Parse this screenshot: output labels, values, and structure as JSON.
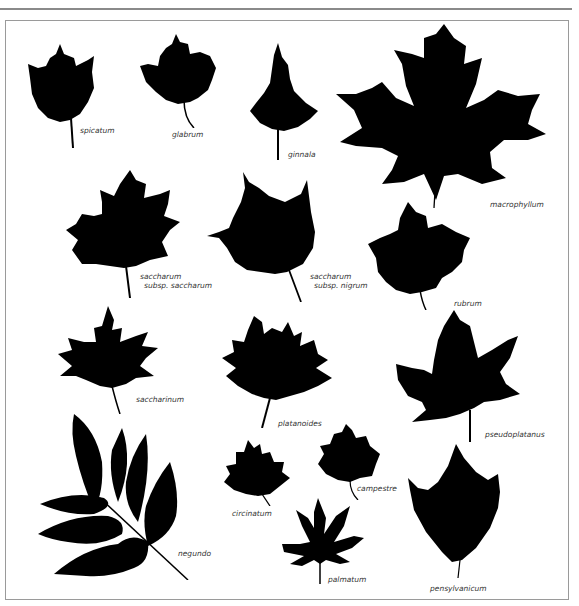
{
  "figure": {
    "title": "",
    "fill_color": "#000000",
    "background": "#ffffff",
    "frame_color": "#9a9a9a"
  },
  "leaves": [
    {
      "id": "spicatum",
      "label": "spicatum"
    },
    {
      "id": "glabrum",
      "label": "glabrum"
    },
    {
      "id": "ginnala",
      "label": "ginnala"
    },
    {
      "id": "macrophyllum",
      "label": "macrophyllum"
    },
    {
      "id": "saccharum-saccharum",
      "label": "saccharum",
      "label2": "subsp. saccharum"
    },
    {
      "id": "saccharum-nigrum",
      "label": "saccharum",
      "label2": "subsp. nigrum"
    },
    {
      "id": "rubrum",
      "label": "rubrum"
    },
    {
      "id": "saccharinum",
      "label": "saccharinum"
    },
    {
      "id": "platanoides",
      "label": "platanoides"
    },
    {
      "id": "pseudoplatanus",
      "label": "pseudoplatanus"
    },
    {
      "id": "negundo",
      "label": "negundo"
    },
    {
      "id": "circinatum",
      "label": "circinatum"
    },
    {
      "id": "campestre",
      "label": "campestre"
    },
    {
      "id": "palmatum",
      "label": "palmatum"
    },
    {
      "id": "pensylvanicum",
      "label": "pensylvanicum"
    }
  ]
}
